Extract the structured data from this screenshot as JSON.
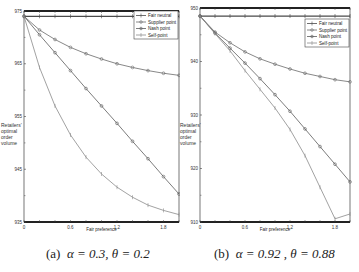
{
  "chart_data": [
    {
      "type": "line",
      "title": "(a) α = 0.3, θ = 0.2",
      "xlabel": "Fair preference",
      "ylabel": "Retailers' optimal order volume",
      "xlim": [
        0,
        2.0
      ],
      "ylim": [
        935,
        975
      ],
      "xticks": [
        "0",
        "0.6",
        "1.2",
        "1.8"
      ],
      "yticks": [
        "975",
        "965",
        "955",
        "945",
        "935"
      ],
      "grid": false,
      "legend_position": "upper right",
      "x": [
        0,
        0.2,
        0.4,
        0.6,
        0.8,
        1.0,
        1.2,
        1.4,
        1.6,
        1.8,
        2.0
      ],
      "series": [
        {
          "name": "Fair neutral",
          "values": [
            974,
            974,
            974,
            974,
            974,
            974,
            974,
            974,
            974,
            974,
            974
          ]
        },
        {
          "name": "Supplier point",
          "values": [
            974,
            971.4,
            969.6,
            968.1,
            966.9,
            965.9,
            965.0,
            964.3,
            963.7,
            963.2,
            962.8
          ]
        },
        {
          "name": "Nash point",
          "values": [
            974,
            970.5,
            967.1,
            963.7,
            960.3,
            957.0,
            953.7,
            950.3,
            947.0,
            943.6,
            940.3
          ]
        },
        {
          "name": "Self point",
          "values": [
            974,
            964.3,
            957.0,
            951.5,
            947.3,
            944.1,
            941.6,
            939.7,
            938.2,
            937.2,
            936.4
          ]
        }
      ]
    },
    {
      "type": "line",
      "title": "(b) α = 0.92, θ = 0.88",
      "xlabel": "Fair preference",
      "ylabel": "Retailers' optimal order volume",
      "xlim": [
        0,
        2.0
      ],
      "ylim": [
        910,
        950
      ],
      "xticks": [
        "0",
        "0.6",
        "1.2",
        "1.8"
      ],
      "yticks": [
        "950",
        "940",
        "930",
        "920",
        "910"
      ],
      "grid": false,
      "legend_position": "upper right",
      "x": [
        0,
        0.2,
        0.4,
        0.6,
        0.8,
        1.0,
        1.2,
        1.4,
        1.6,
        1.8,
        2.0
      ],
      "series": [
        {
          "name": "Fair neutral",
          "values": [
            948.5,
            948.5,
            948.5,
            948.5,
            948.5,
            948.5,
            948.5,
            948.5,
            948.5,
            948.5,
            948.5
          ]
        },
        {
          "name": "Supplier point",
          "values": [
            948.5,
            945.5,
            943.5,
            941.8,
            940.5,
            939.5,
            938.6,
            937.8,
            937.2,
            936.6,
            936.2
          ]
        },
        {
          "name": "Nash point",
          "values": [
            948.5,
            945.3,
            942.5,
            939.7,
            936.8,
            933.8,
            930.7,
            927.4,
            924.1,
            920.8,
            917.5
          ]
        },
        {
          "name": "Self point",
          "values": [
            948.5,
            945.2,
            942.0,
            938.3,
            934.8,
            931.3,
            927.3,
            922.4,
            916.5,
            910.6,
            911.5
          ]
        }
      ]
    }
  ],
  "panels": [
    {
      "caption_tag": "(a)",
      "caption_params": "α = 0.3,  θ = 0.2",
      "xlabel": "Fair preference",
      "ylabel_lines": [
        "Retailers'",
        "optimal",
        "order",
        "volume"
      ],
      "xticks": [
        "0",
        "0.6",
        "1.2",
        "1.8"
      ],
      "yticks": [
        "975",
        "965",
        "955",
        "945",
        "935"
      ],
      "legend": [
        "Fair neutral",
        "Supplier point",
        "Nash point",
        "Self-point"
      ]
    },
    {
      "caption_tag": "(b)",
      "caption_params": "α = 0.92 , θ = 0.88",
      "xlabel": "Fair preference",
      "ylabel_lines": [
        "Retailers'",
        "optimal",
        "order",
        "volume"
      ],
      "xticks": [
        "0",
        "0.6",
        "1.2",
        "1.8"
      ],
      "yticks": [
        "950",
        "940",
        "930",
        "920",
        "910"
      ],
      "legend": [
        "Fair neutral",
        "Supplier point",
        "Nash point",
        "Self-point"
      ]
    }
  ],
  "colors": {
    "fair_neutral": "#4a4a4a",
    "supplier_point": "#6a6a6a",
    "nash_point": "#5a5a5a",
    "self_point": "#8a8a8a",
    "axis": "#222222"
  }
}
